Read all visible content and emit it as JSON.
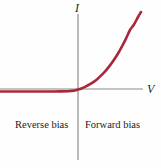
{
  "figure": {
    "name": "diode-iv-characteristic",
    "background_color": "#fefefe"
  },
  "axes": {
    "vertical": {
      "label": "I",
      "color": "#8a8a8a",
      "x_px": 78,
      "y_top_px": 14,
      "y_bottom_px": 160
    },
    "horizontal": {
      "label": "V",
      "color": "#8a8a8a",
      "y_px": 89,
      "x_left_px": 0,
      "x_right_px": 143
    }
  },
  "regions": {
    "left_label": "Reverse bias",
    "right_label": "Forward bias"
  },
  "chart_data": {
    "type": "line",
    "title": "",
    "xlabel": "V",
    "ylabel": "I",
    "grid": false,
    "legend": null,
    "xlim": [
      -78,
      65
    ],
    "ylim": [
      -75,
      77
    ],
    "series": [
      {
        "name": "Diode I-V characteristic",
        "color": "#a8273a",
        "linewidth": 2.6,
        "x": [
          -78,
          -68,
          -58,
          -48,
          -38,
          -28,
          -18,
          -10,
          -4,
          0,
          4,
          8,
          12,
          16,
          20,
          24,
          28,
          32,
          36,
          40,
          44,
          48,
          52,
          56,
          60,
          63
        ],
        "y": [
          -2.5,
          -2.5,
          -2.5,
          -2.5,
          -2.5,
          -2.5,
          -2.4,
          -2.2,
          -1.6,
          -0.6,
          0.8,
          2.6,
          4.8,
          7.4,
          10.6,
          14.3,
          18.6,
          23.6,
          29.2,
          35.5,
          42.6,
          50.4,
          59.0,
          64.5,
          72.0,
          77.0
        ]
      }
    ],
    "annotations": [
      {
        "text": "Reverse bias",
        "x": -45,
        "y": -32
      },
      {
        "text": "Forward bias",
        "x": 18,
        "y": -32
      }
    ]
  }
}
